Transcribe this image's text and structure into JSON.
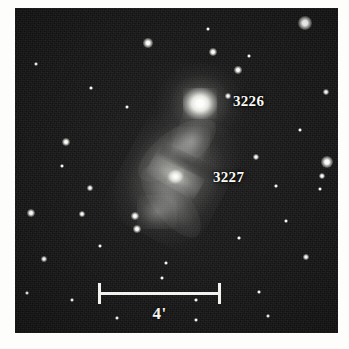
{
  "figure": {
    "kind": "astronomical-plate",
    "background_color": "#151515",
    "margin_color": "#fdfdfb",
    "ink_color": "#fbfbf7",
    "field": {
      "left": 15,
      "top": 8,
      "width": 323,
      "height": 325
    }
  },
  "labels": [
    {
      "id": "ngc3226",
      "text": "3226",
      "x": 233,
      "y": 93
    },
    {
      "id": "ngc3227",
      "text": "3227",
      "x": 213,
      "y": 169
    }
  ],
  "scalebar": {
    "label": "4'",
    "left": 98,
    "top": 283,
    "width": 123
  },
  "galaxies": [
    {
      "id": "ngc3226",
      "name": "3226",
      "type": "elliptical",
      "center_x": 200,
      "center_y": 103,
      "core_brightness": 1.0
    },
    {
      "id": "ngc3227",
      "name": "3227",
      "type": "barred-spiral",
      "center_x": 175,
      "center_y": 176,
      "position_angle": 28,
      "core_brightness": 0.85
    }
  ],
  "stars": [
    {
      "x": 305,
      "y": 23,
      "r": 7.0
    },
    {
      "x": 148,
      "y": 43,
      "r": 4.6
    },
    {
      "x": 213,
      "y": 52,
      "r": 4.4
    },
    {
      "x": 208,
      "y": 29,
      "r": 2.4
    },
    {
      "x": 238,
      "y": 70,
      "r": 3.6
    },
    {
      "x": 326,
      "y": 92,
      "r": 2.8
    },
    {
      "x": 249,
      "y": 56,
      "r": 2.2
    },
    {
      "x": 228,
      "y": 96,
      "r": 2.6
    },
    {
      "x": 66,
      "y": 142,
      "r": 4.2
    },
    {
      "x": 327,
      "y": 162,
      "r": 6.0
    },
    {
      "x": 322,
      "y": 176,
      "r": 3.0
    },
    {
      "x": 320,
      "y": 189,
      "r": 2.2
    },
    {
      "x": 256,
      "y": 157,
      "r": 3.4
    },
    {
      "x": 90,
      "y": 188,
      "r": 2.6
    },
    {
      "x": 31,
      "y": 213,
      "r": 4.0
    },
    {
      "x": 82,
      "y": 214,
      "r": 2.6
    },
    {
      "x": 135,
      "y": 216,
      "r": 3.6
    },
    {
      "x": 137,
      "y": 229,
      "r": 4.4
    },
    {
      "x": 62,
      "y": 166,
      "r": 2.0
    },
    {
      "x": 44,
      "y": 259,
      "r": 2.6
    },
    {
      "x": 100,
      "y": 246,
      "r": 2.0
    },
    {
      "x": 166,
      "y": 263,
      "r": 2.2
    },
    {
      "x": 286,
      "y": 221,
      "r": 2.2
    },
    {
      "x": 306,
      "y": 257,
      "r": 2.6
    },
    {
      "x": 259,
      "y": 292,
      "r": 2.2
    },
    {
      "x": 162,
      "y": 278,
      "r": 2.4
    },
    {
      "x": 117,
      "y": 318,
      "r": 2.4
    },
    {
      "x": 72,
      "y": 300,
      "r": 2.2
    },
    {
      "x": 27,
      "y": 293,
      "r": 2.0
    },
    {
      "x": 196,
      "y": 320,
      "r": 2.0
    },
    {
      "x": 268,
      "y": 316,
      "r": 2.0
    },
    {
      "x": 300,
      "y": 130,
      "r": 2.0
    },
    {
      "x": 36,
      "y": 64,
      "r": 2.0
    },
    {
      "x": 127,
      "y": 107,
      "r": 2.0
    },
    {
      "x": 91,
      "y": 88,
      "r": 1.8
    },
    {
      "x": 276,
      "y": 186,
      "r": 1.8
    },
    {
      "x": 239,
      "y": 238,
      "r": 1.8
    },
    {
      "x": 196,
      "y": 300,
      "r": 1.8
    }
  ]
}
